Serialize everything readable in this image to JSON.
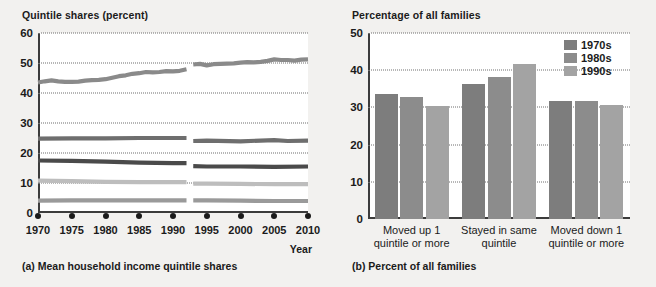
{
  "figure": {
    "panel_a": {
      "axis_title": "Quintile shares (percent)",
      "caption": "(a) Mean household income quintile shares",
      "xaxis_name": "Year"
    },
    "panel_b": {
      "axis_title": "Percentage of all families",
      "caption": "(b) Percent of all families"
    }
  },
  "chart_data": [
    {
      "type": "line",
      "title": "(a) Mean household income quintile shares",
      "ylabel": "Quintile shares (percent)",
      "xlabel": "Year",
      "ylim": [
        0,
        60
      ],
      "yticks": [
        0,
        10,
        20,
        30,
        40,
        50,
        60
      ],
      "xlim": [
        1970,
        2010
      ],
      "xticks": [
        1970,
        1975,
        1980,
        1985,
        1990,
        1995,
        2000,
        2005,
        2010
      ],
      "xtick_labels": [
        "1970",
        "1975",
        "1980",
        "1985",
        "1990",
        "1995",
        "2000",
        "2005",
        "2010"
      ],
      "grid": "horizontal-dotted",
      "series_break_between": [
        1992,
        1993
      ],
      "legend": "none",
      "series": [
        {
          "name": "Highest quintile",
          "color": "#8a8a8a",
          "segments": [
            {
              "x": [
                1970,
                1971,
                1972,
                1973,
                1974,
                1975,
                1976,
                1977,
                1978,
                1979,
                1980,
                1981,
                1982,
                1983,
                1984,
                1985,
                1986,
                1987,
                1988,
                1989,
                1990,
                1991,
                1992
              ],
              "y": [
                43.5,
                43.9,
                44.2,
                43.9,
                43.7,
                43.7,
                43.8,
                44.1,
                44.3,
                44.4,
                44.6,
                45.1,
                45.6,
                45.9,
                46.4,
                46.6,
                47.0,
                46.9,
                47.0,
                47.3,
                47.2,
                47.4,
                47.9
              ]
            },
            {
              "x": [
                1993,
                1994,
                1995,
                1996,
                1997,
                1998,
                1999,
                2000,
                2001,
                2002,
                2003,
                2004,
                2005,
                2006,
                2007,
                2008,
                2009,
                2010
              ],
              "y": [
                49.5,
                49.7,
                49.2,
                49.6,
                49.7,
                49.8,
                49.9,
                50.1,
                50.3,
                50.2,
                50.4,
                50.7,
                51.2,
                51.0,
                51.0,
                50.8,
                51.1,
                51.2
              ]
            }
          ]
        },
        {
          "name": "Fourth quintile",
          "color": "#6e6e6e",
          "segments": [
            {
              "x": [
                1970,
                1975,
                1980,
                1985,
                1990,
                1992
              ],
              "y": [
                24.8,
                24.9,
                24.9,
                25.0,
                25.0,
                25.0
              ]
            },
            {
              "x": [
                1993,
                1995,
                2000,
                2005,
                2007,
                2010
              ],
              "y": [
                24.0,
                24.1,
                23.9,
                24.3,
                24.0,
                24.1
              ]
            }
          ]
        },
        {
          "name": "Third quintile",
          "color": "#4a4a4a",
          "segments": [
            {
              "x": [
                1970,
                1975,
                1980,
                1985,
                1990,
                1992
              ],
              "y": [
                17.5,
                17.4,
                17.1,
                16.8,
                16.6,
                16.6
              ]
            },
            {
              "x": [
                1993,
                1995,
                2000,
                2005,
                2010
              ],
              "y": [
                15.6,
                15.5,
                15.5,
                15.4,
                15.5
              ]
            }
          ]
        },
        {
          "name": "Second quintile",
          "color": "#bdbdbd",
          "segments": [
            {
              "x": [
                1970,
                1975,
                1980,
                1985,
                1990,
                1992
              ],
              "y": [
                10.8,
                10.6,
                10.4,
                10.3,
                10.3,
                10.3
              ]
            },
            {
              "x": [
                1993,
                1995,
                2000,
                2005,
                2010
              ],
              "y": [
                9.8,
                9.8,
                9.7,
                9.6,
                9.6
              ]
            }
          ]
        },
        {
          "name": "Lowest quintile",
          "color": "#9a9a9a",
          "segments": [
            {
              "x": [
                1970,
                1975,
                1980,
                1985,
                1990,
                1992
              ],
              "y": [
                4.1,
                4.2,
                4.2,
                4.2,
                4.2,
                4.2
              ]
            },
            {
              "x": [
                1993,
                1995,
                2000,
                2005,
                2010
              ],
              "y": [
                4.2,
                4.2,
                4.1,
                4.0,
                4.0
              ]
            }
          ]
        }
      ]
    },
    {
      "type": "bar",
      "title": "(b) Percent of all families",
      "ylabel": "Percentage of all families",
      "xlabel": "",
      "ylim": [
        0,
        50
      ],
      "yticks": [
        0,
        10,
        20,
        30,
        40,
        50
      ],
      "grid": "horizontal-dotted",
      "legend_position": "top-right",
      "categories": [
        "Moved up 1 quintile or more",
        "Stayed in same quintile",
        "Moved down 1 quintile or more"
      ],
      "category_lines": [
        [
          "Moved up 1",
          "quintile or more"
        ],
        [
          "Stayed in same",
          "quintile"
        ],
        [
          "Moved down 1",
          "quintile or more"
        ]
      ],
      "series": [
        {
          "name": "1970s",
          "color": "#7d7d7d",
          "values": [
            33.5,
            36.3,
            31.8
          ]
        },
        {
          "name": "1980s",
          "color": "#8c8c8c",
          "values": [
            32.7,
            38.3,
            31.7
          ]
        },
        {
          "name": "1990s",
          "color": "#a3a3a3",
          "values": [
            30.5,
            41.7,
            30.7
          ]
        }
      ]
    }
  ]
}
